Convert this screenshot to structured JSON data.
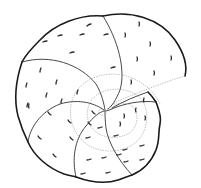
{
  "figure": {
    "title": "Spiral chambered shell (foraminifera) line drawing",
    "style": "scientific pen illustration",
    "colors": {
      "background": "#ffffff",
      "ink": "#1a1a1a",
      "suture": "#333333",
      "inner_whorl": "#9a9a9a"
    },
    "umbilicus_center": [
      105,
      111
    ],
    "outer_chamber_count": 6,
    "pore_mark_count": 46
  }
}
